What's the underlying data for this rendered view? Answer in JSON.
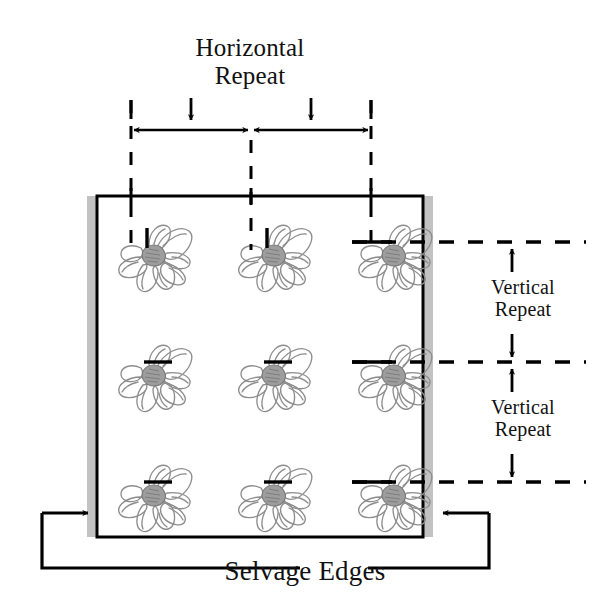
{
  "diagram": {
    "labels": {
      "horizontal_repeat_line1": "Horizontal",
      "horizontal_repeat_line2": "Repeat",
      "vertical_repeat_1_line1": "Vertical",
      "vertical_repeat_1_line2": "Repeat",
      "vertical_repeat_2_line1": "Vertical",
      "vertical_repeat_2_line2": "Repeat",
      "selvage_edges": "Selvage Edges"
    },
    "colors": {
      "line": "#000000",
      "selvage_fill": "#c0c0c0",
      "motif_stroke": "#8a8a8a",
      "motif_center": "#9a9a9a",
      "fabric_fill": "#ffffff",
      "background": "#ffffff"
    },
    "fabric": {
      "left": 97,
      "top": 196,
      "right": 423,
      "bottom": 537,
      "border_width": 3
    },
    "selvage": {
      "width": 10,
      "left_x": 87,
      "right_x": 423,
      "top": 196,
      "bottom": 537
    },
    "motif_grid": {
      "columns_x": [
        151,
        271,
        391
      ],
      "rows_y": [
        242,
        362,
        482
      ],
      "count": 9,
      "motif_name": "flower-motif"
    },
    "guides": {
      "vertical_dashed_x": [
        131,
        251,
        371
      ],
      "vertical_dashed_top": 100,
      "vertical_dashed_bottom": 248,
      "horizontal_dashed_y": [
        242,
        362,
        482
      ],
      "horizontal_dashed_left": 355,
      "horizontal_dashed_right": 585
    },
    "dimensions": {
      "horizontal": {
        "axis_y": 130,
        "segments": [
          {
            "from": 131,
            "to": 251
          },
          {
            "from": 251,
            "to": 371
          }
        ],
        "pointer_arrows_x": [
          191,
          311
        ],
        "pointer_arrow_top": 98,
        "pointer_arrow_bottom": 124,
        "tick_top": 100,
        "tick_bottom": 118
      },
      "vertical": {
        "arrow_x": 512,
        "segments": [
          {
            "from": 242,
            "to": 362
          },
          {
            "from": 362,
            "to": 482
          }
        ]
      }
    },
    "selvage_leaders": {
      "bottom_y": 568,
      "left": {
        "arrow_x": 92,
        "arrow_y": 513,
        "corner_x": 42
      },
      "right": {
        "arrow_x": 440,
        "arrow_y": 513,
        "corner_x": 489
      },
      "left_line_end": 300,
      "right_line_start": 365
    }
  }
}
